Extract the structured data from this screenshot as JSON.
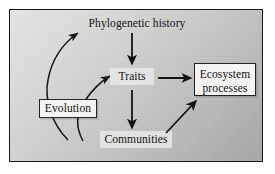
{
  "figure": {
    "type": "conceptual-flow-diagram",
    "panel": {
      "background_gradient_from": "#e6e6e6",
      "background_gradient_to": "#a8a8a8",
      "border_color": "#17171a"
    }
  },
  "nodes": [
    {
      "id": "phylogenetic-history",
      "label": "Phylogenetic history",
      "style": "plain",
      "lines": [
        "Phylogenetic history"
      ]
    },
    {
      "id": "traits",
      "label": "Traits",
      "style": "light-box",
      "lines": [
        "Traits"
      ]
    },
    {
      "id": "communities",
      "label": "Communities",
      "style": "light-box",
      "lines": [
        "Communities"
      ]
    },
    {
      "id": "evolution",
      "label": "Evolution",
      "style": "framed-box",
      "lines": [
        "Evolution"
      ]
    },
    {
      "id": "ecosystem-processes",
      "label": "Ecosystem processes",
      "style": "framed-box",
      "lines": [
        "Ecosystem",
        "processes"
      ]
    }
  ],
  "edges": [
    {
      "id": "phylogenetic-history-to-traits",
      "from": "phylogenetic-history",
      "to": "traits",
      "shape": "straight",
      "direction": "down"
    },
    {
      "id": "traits-to-communities",
      "from": "traits",
      "to": "communities",
      "shape": "straight",
      "direction": "down"
    },
    {
      "id": "traits-to-ecosystem-processes",
      "from": "traits",
      "to": "ecosystem-processes",
      "shape": "straight",
      "direction": "right"
    },
    {
      "id": "communities-to-ecosystem-processes",
      "from": "communities",
      "to": "ecosystem-processes",
      "shape": "straight",
      "direction": "up-right"
    },
    {
      "id": "evolution-to-phylogenetic-history",
      "from": "evolution",
      "to": "phylogenetic-history",
      "shape": "curved",
      "direction": "up"
    },
    {
      "id": "evolution-to-traits",
      "from": "evolution",
      "to": "traits",
      "shape": "curved",
      "direction": "up-right"
    }
  ],
  "node_text": {
    "phylogenetic_history": "Phylogenetic history",
    "traits": "Traits",
    "communities": "Communities",
    "evolution": "Evolution",
    "ecosystem_line1": "Ecosystem",
    "ecosystem_line2": "processes"
  },
  "colors": {
    "ink": "#131316",
    "arrow": "#151518",
    "box_fill": "#f4f4f2",
    "light_box_fill": "#e9e9e7"
  }
}
